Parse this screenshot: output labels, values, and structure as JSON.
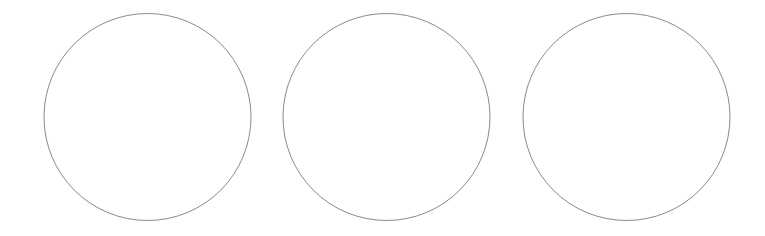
{
  "canvas": {
    "width": 765,
    "height": 236,
    "background": "#ffffff"
  },
  "style": {
    "stroke_color": "#8a8a8a",
    "stroke_width": 1,
    "fill_color": "#ffffff"
  },
  "circles": [
    {
      "cx": 147.5,
      "cy": 117,
      "r": 103.5
    },
    {
      "cx": 386.5,
      "cy": 117,
      "r": 103.5
    },
    {
      "cx": 626.5,
      "cy": 117,
      "r": 103.5
    }
  ]
}
